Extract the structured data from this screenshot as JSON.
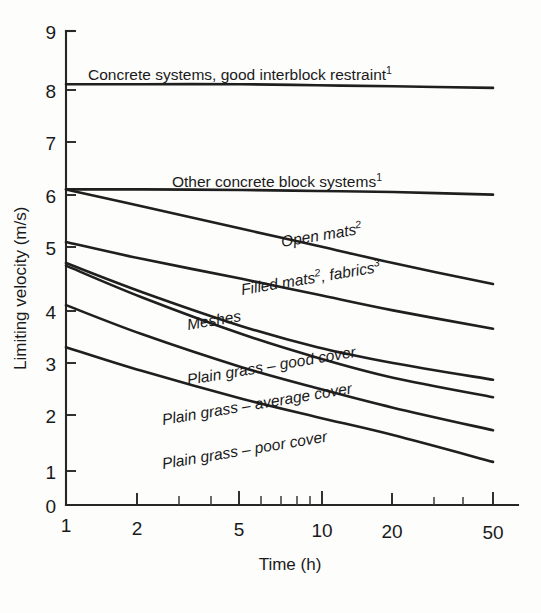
{
  "figure": {
    "background_color": "#fdfdfc",
    "ink_color": "#1f1f1f"
  },
  "chart_data": {
    "type": "line",
    "title": "",
    "xlabel": "Time (h)",
    "ylabel": "Limiting velocity (m/s)",
    "x_scale": "log",
    "y_scale": "linear",
    "xlim": [
      1,
      55
    ],
    "ylim": [
      0,
      9
    ],
    "grid": false,
    "legend": "inline-curve-labels",
    "x_tick_labels": [
      "1",
      "2",
      "5",
      "10",
      "20",
      "50"
    ],
    "x_tick_values": [
      1,
      2,
      5,
      10,
      20,
      50
    ],
    "x_minor_ticks": [
      3,
      4,
      6,
      7,
      8,
      9,
      30,
      40
    ],
    "y_tick_labels": [
      "0",
      "1",
      "2",
      "3",
      "4",
      "5",
      "6",
      "7",
      "8",
      "9"
    ],
    "y_tick_values": [
      0,
      1,
      2,
      3,
      4,
      5,
      6,
      7,
      8,
      9
    ],
    "x": [
      1,
      2,
      5,
      10,
      20,
      50
    ],
    "series": [
      {
        "name": "Concrete systems, good interblock restraint",
        "label": "Concrete systems, good interblock restraint",
        "footnote": "1",
        "label_style": "upright",
        "values": [
          8.0,
          8.0,
          8.0,
          7.98,
          7.96,
          7.93
        ]
      },
      {
        "name": "Other concrete block systems",
        "label": "Other concrete block systems",
        "footnote": "1",
        "label_style": "upright",
        "values": [
          6.0,
          6.0,
          5.99,
          5.97,
          5.95,
          5.9
        ]
      },
      {
        "name": "Open mats",
        "label": "Open mats",
        "footnote": "2",
        "label_style": "italic",
        "values": [
          6.0,
          5.68,
          5.25,
          4.93,
          4.6,
          4.2
        ]
      },
      {
        "name": "Filled mats, fabrics",
        "label": "Filled mats, fabrics",
        "footnote": "2,3",
        "label_style": "italic",
        "values": [
          5.0,
          4.68,
          4.3,
          4.0,
          3.7,
          3.35
        ]
      },
      {
        "name": "Meshes",
        "label": "Meshes",
        "footnote": "",
        "label_style": "italic",
        "values": [
          4.6,
          4.05,
          3.4,
          3.0,
          2.7,
          2.38
        ]
      },
      {
        "name": "Plain grass - good cover",
        "label": "Plain grass – good cover",
        "footnote": "",
        "label_style": "italic",
        "values": [
          4.55,
          3.95,
          3.25,
          2.8,
          2.42,
          2.05
        ]
      },
      {
        "name": "Plain grass - average cover",
        "label": "Plain grass – average cover",
        "footnote": "",
        "label_style": "italic",
        "values": [
          3.8,
          3.25,
          2.62,
          2.22,
          1.85,
          1.42
        ]
      },
      {
        "name": "Plain grass - poor cover",
        "label": "Plain grass – poor cover",
        "footnote": "",
        "label_style": "italic",
        "values": [
          3.0,
          2.55,
          2.02,
          1.67,
          1.33,
          0.82
        ]
      }
    ]
  },
  "axes": {
    "y_axis_title": "Limiting velocity (m/s)",
    "x_axis_title": "Time (h)",
    "y_labels": [
      "9",
      "8",
      "7",
      "6",
      "5",
      "4",
      "3",
      "2",
      "1",
      "0"
    ],
    "x_labels": [
      "1",
      "2",
      "5",
      "10",
      "20",
      "50"
    ]
  },
  "curve_labels": [
    {
      "text": "Concrete systems, good interblock restraint",
      "sup": "1"
    },
    {
      "text": "Other concrete block systems",
      "sup": "1"
    },
    {
      "text": "Open mats",
      "sup": "2"
    },
    {
      "text": "Filled mats",
      "sup": "2"
    },
    {
      "text": ", fabrics",
      "sup": "3"
    },
    {
      "text": "Meshes",
      "sup": ""
    },
    {
      "text": "Plain grass – good cover",
      "sup": ""
    },
    {
      "text": "Plain grass – average cover",
      "sup": ""
    },
    {
      "text": "Plain grass – poor cover",
      "sup": ""
    }
  ]
}
